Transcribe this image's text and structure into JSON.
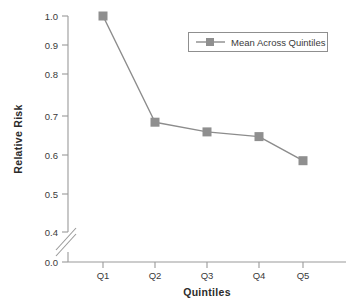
{
  "chart_data": {
    "type": "line",
    "title": "",
    "subtitle": "",
    "xlabel": "Quintiles",
    "ylabel": "Relative Risk",
    "categories": [
      "Q1",
      "Q2",
      "Q3",
      "Q4",
      "Q5"
    ],
    "series": [
      {
        "name": "Mean Across Quintiles",
        "values": [
          1.0,
          0.705,
          0.678,
          0.665,
          0.598
        ],
        "marker": "square",
        "color": "#8c8c8c"
      }
    ],
    "ylim": [
      0.0,
      1.0
    ],
    "y_ticks": [
      "0.0",
      "0.4",
      "0.5",
      "0.6",
      "0.7",
      "0.8",
      "0.9",
      "1.0"
    ],
    "x_ticks": [
      "Q1",
      "Q2",
      "Q3",
      "Q4",
      "Q5"
    ],
    "grid": false,
    "axis_break": true,
    "axis_break_note": "broken y-axis between 0.0 and 0.4",
    "legend": {
      "position": "top-right",
      "entries": [
        "Mean Across Quintiles"
      ],
      "boxed": true
    }
  },
  "axes": {
    "y_label": "Relative Risk",
    "x_label": "Quintiles",
    "y_ticks": [
      {
        "label": "1.0",
        "value": 1.0
      },
      {
        "label": "0.9",
        "value": 0.9
      },
      {
        "label": "0.8",
        "value": 0.8
      },
      {
        "label": "0.7",
        "value": 0.7
      },
      {
        "label": "0.6",
        "value": 0.6
      },
      {
        "label": "0.5",
        "value": 0.5
      },
      {
        "label": "0.4",
        "value": 0.4
      },
      {
        "label": "0.0",
        "value": 0.0
      }
    ],
    "x_ticks": [
      {
        "label": "Q1"
      },
      {
        "label": "Q2"
      },
      {
        "label": "Q3"
      },
      {
        "label": "Q4"
      },
      {
        "label": "Q5"
      }
    ]
  },
  "legend": {
    "label": "Mean Across Quintiles"
  },
  "colors": {
    "series": "#8c8c8c",
    "axis": "#9a9a9a",
    "text": "#3a3a3a",
    "label": "#2b2b2b",
    "legend_border": "#8f8f8f",
    "background": "#ffffff"
  }
}
